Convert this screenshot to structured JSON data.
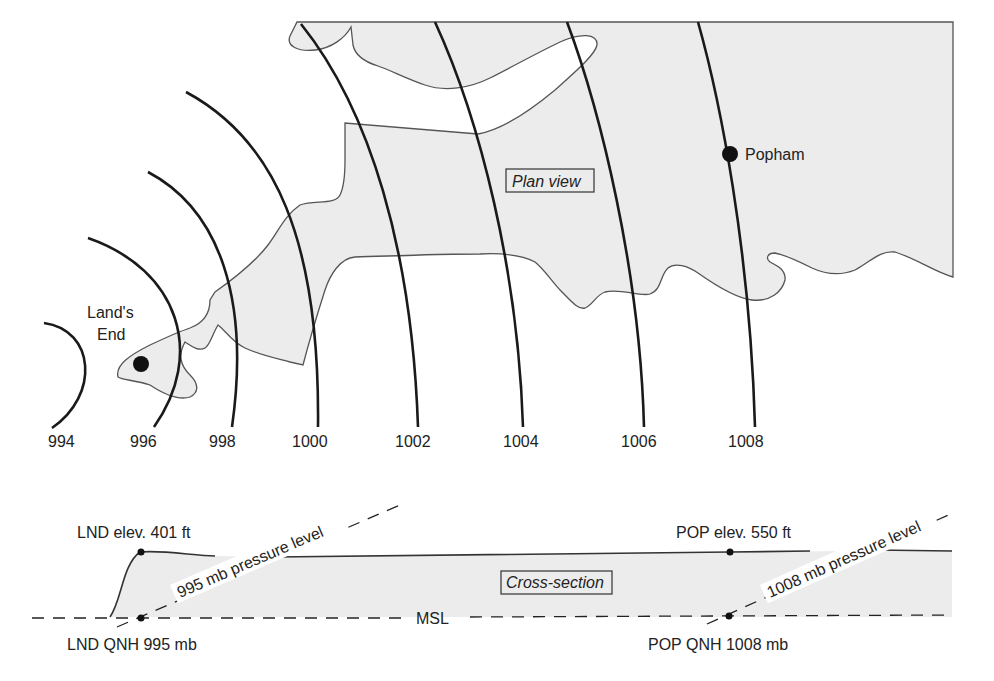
{
  "plan_view": {
    "label": "Plan view",
    "isobars": [
      {
        "value": "994",
        "label_x": 59
      },
      {
        "value": "996",
        "label_x": 146
      },
      {
        "value": "998",
        "label_x": 224
      },
      {
        "value": "1000",
        "label_x": 316
      },
      {
        "value": "1002",
        "label_x": 416
      },
      {
        "value": "1004",
        "label_x": 522
      },
      {
        "value": "1006",
        "label_x": 642
      },
      {
        "value": "1008",
        "label_x": 749
      }
    ],
    "locations": {
      "lands_end_line1": "Land's",
      "lands_end_line2": "End",
      "popham": "Popham"
    }
  },
  "cross_section": {
    "label": "Cross-section",
    "lnd_elev": "LND elev. 401 ft",
    "lnd_qnh": "LND QNH 995 mb",
    "pop_elev": "POP elev. 550 ft",
    "pop_qnh": "POP QNH 1008 mb",
    "msl": "MSL",
    "pressure_level_left": "995 mb pressure level",
    "pressure_level_right": "1008 mb pressure level"
  },
  "colors": {
    "land": "#ececec",
    "isobar": "#1a1a1a",
    "coast": "#555555"
  }
}
